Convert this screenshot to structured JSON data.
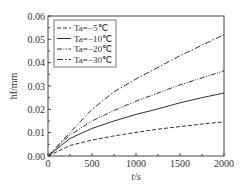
{
  "chart_data": {
    "type": "line",
    "title": "",
    "xlabel": "t/s",
    "ylabel": "h_f/mm",
    "xlim": [
      0,
      2000
    ],
    "ylim": [
      0,
      0.06
    ],
    "xticks": [
      "0",
      "500",
      "1000",
      "1500",
      "2000"
    ],
    "yticks": [
      "0.00",
      "0.01",
      "0.02",
      "0.03",
      "0.04",
      "0.05",
      "0.06"
    ],
    "legend_position": "upper left",
    "x": [
      0,
      250,
      500,
      750,
      1000,
      1250,
      1500,
      1750,
      2000
    ],
    "series": [
      {
        "name": "Ta=-5℃",
        "style": "dashed",
        "values": [
          0,
          0.0045,
          0.0068,
          0.0086,
          0.0101,
          0.0115,
          0.0126,
          0.0137,
          0.0146
        ]
      },
      {
        "name": "Ta=-10℃",
        "style": "solid",
        "values": [
          0,
          0.0075,
          0.0118,
          0.015,
          0.0178,
          0.0202,
          0.0228,
          0.025,
          0.027
        ]
      },
      {
        "name": "Ta=-20℃",
        "style": "dash-dot-dot",
        "values": [
          0,
          0.009,
          0.015,
          0.0195,
          0.0235,
          0.027,
          0.0305,
          0.0335,
          0.0365
        ]
      },
      {
        "name": "Ta=-30℃",
        "style": "dash-dot",
        "values": [
          0,
          0.01,
          0.02,
          0.0275,
          0.033,
          0.038,
          0.043,
          0.0475,
          0.052
        ]
      }
    ]
  },
  "legend": [
    {
      "label": "Ta=−5℃"
    },
    {
      "label": "Ta=−10℃"
    },
    {
      "label": "Ta=−20℃"
    },
    {
      "label": "Ta=−30℃"
    }
  ],
  "axes": {
    "xlabel": "t/s",
    "ylabel": "h_f/mm"
  }
}
